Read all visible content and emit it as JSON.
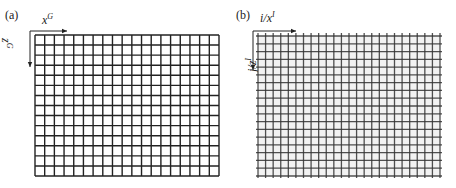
{
  "panels": [
    {
      "label": "(a)",
      "x_axis": {
        "var": "x",
        "sup": "G"
      },
      "z_axis": {
        "var": "z",
        "sup": "G"
      },
      "grid": {
        "cols": 19,
        "rows": 14,
        "style": "regular",
        "line_color": "#222222"
      }
    },
    {
      "label": "(b)",
      "x_axis": {
        "var": "i/x",
        "sup": "I"
      },
      "z_axis": {
        "var": "j/z",
        "sup": "I"
      },
      "grid": {
        "cols": 24,
        "rows": 18,
        "style": "image-grid-with-overhang",
        "line_color": "#333333"
      }
    }
  ]
}
